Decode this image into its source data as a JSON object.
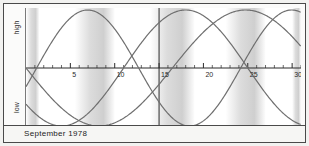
{
  "caption": {
    "text": "September 1978"
  },
  "yaxis": {
    "high_label": "high",
    "low_label": "low"
  },
  "chart_data": {
    "type": "line",
    "title": "September 1978",
    "xlabel": "",
    "ylabel": "",
    "xlim": [
      0,
      31
    ],
    "ylim": [
      -1,
      1
    ],
    "grid": false,
    "legend": "none",
    "tick_labels": [
      "5",
      "10",
      "15",
      "20",
      "25",
      "30"
    ],
    "tick_values": [
      5,
      10,
      15,
      20,
      25,
      30
    ],
    "minor_tick_step": 1,
    "y_tick_labels": [
      "high",
      "low"
    ],
    "curve_color": "#6f6f6f",
    "axis_color": "#2b2b2b",
    "band_color_light": "#ffffff",
    "band_color_shade": "#d8d8d8",
    "today_marker": {
      "day": 15,
      "label": ""
    },
    "shaded_bands": [
      {
        "start": 0,
        "end": 1.5
      },
      {
        "start": 5.5,
        "end": 10.0
      },
      {
        "start": 14.0,
        "end": 19.0
      },
      {
        "start": 22.5,
        "end": 27.0
      },
      {
        "start": 30.0,
        "end": 31.0
      }
    ],
    "series": [
      {
        "name": "physical",
        "period_days": 23,
        "phase_day": 1.2,
        "amplitude": 1.0,
        "color": "#6f6f6f",
        "values_at_ticks": {
          "5": -0.87,
          "10": 0.28,
          "15": 0.96,
          "20": 0.09,
          "25": -0.95,
          "30": -0.43
        }
      },
      {
        "name": "emotional",
        "period_days": 28,
        "phase_day": 11.0,
        "amplitude": 1.0,
        "color": "#6f6f6f",
        "values_at_ticks": {
          "5": -0.9,
          "10": -0.22,
          "15": 0.78,
          "20": 0.97,
          "25": 0.3,
          "30": -0.67
        }
      },
      {
        "name": "intellectual",
        "period_days": 33,
        "phase_day": 16.5,
        "amplitude": 1.0,
        "color": "#6f6f6f",
        "values_at_ticks": {
          "5": 0.59,
          "10": -0.09,
          "15": -0.73,
          "20": -0.99,
          "25": -0.53,
          "30": 0.27
        }
      }
    ]
  }
}
